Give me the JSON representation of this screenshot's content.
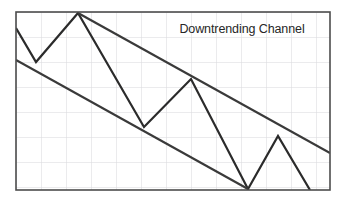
{
  "figure": {
    "title": "Downtrending Channel",
    "background_color": "#ffffff",
    "plot_background_color": "#ffffff",
    "border_color": "#4d4d4d",
    "grid_color": "#d8d8dc",
    "price_line_color": "#2b2b2b",
    "trendline_color": "#3a3a3a"
  },
  "annotation": {
    "text": "Downtrending Channel"
  },
  "chart_data": {
    "type": "line",
    "title": "Downtrending Channel",
    "subtitle": "",
    "xlabel": "",
    "ylabel": "",
    "xlim": [
      0,
      314
    ],
    "ylim": [
      0,
      178
    ],
    "grid": true,
    "grid_spacing_x": 25,
    "grid_spacing_y": 25,
    "legend_position": "none",
    "axis_tick_labels_x": [],
    "axis_tick_labels_y": [],
    "plot_area": {
      "x": 16,
      "y": 12,
      "width": 314,
      "height": 178
    },
    "series": [
      {
        "name": "Price",
        "type": "zigzag-line",
        "color": "#2b2b2b",
        "width": 2.2,
        "points": [
          {
            "x": 16,
            "y": 28
          },
          {
            "x": 36,
            "y": 62
          },
          {
            "x": 78,
            "y": 13
          },
          {
            "x": 144,
            "y": 127
          },
          {
            "x": 191,
            "y": 79
          },
          {
            "x": 248,
            "y": 189
          },
          {
            "x": 278,
            "y": 136
          },
          {
            "x": 310,
            "y": 190
          }
        ]
      },
      {
        "name": "Upper Channel Trendline",
        "type": "trendline",
        "color": "#3a3a3a",
        "width": 2.2,
        "points": [
          {
            "x": 78,
            "y": 13
          },
          {
            "x": 330,
            "y": 153
          }
        ]
      },
      {
        "name": "Lower Channel Trendline",
        "type": "trendline",
        "color": "#3a3a3a",
        "width": 2.2,
        "points": [
          {
            "x": 16,
            "y": 60
          },
          {
            "x": 248,
            "y": 189
          }
        ]
      }
    ],
    "annotations": [
      {
        "text": "Downtrending Channel",
        "x": 242,
        "y": 29,
        "color": "#262626",
        "font_size": 12.5,
        "align": "center"
      }
    ]
  }
}
